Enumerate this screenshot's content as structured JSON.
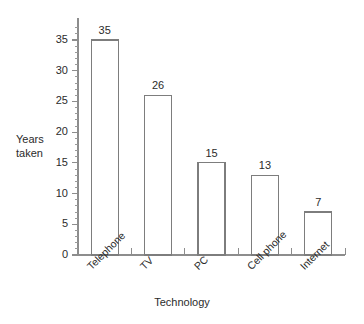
{
  "chart_data": {
    "type": "bar",
    "title": "",
    "subtitle": "",
    "xlabel": "Technology",
    "ylabel": "Years taken",
    "categories": [
      "Telephone",
      "TV",
      "PC",
      "Cell phone",
      "Internet"
    ],
    "values": [
      35,
      26,
      15,
      13,
      7
    ],
    "series": [
      {
        "name": "Years taken",
        "values": [
          35,
          26,
          15,
          13,
          7
        ]
      }
    ],
    "data_labels": [
      "35",
      "26",
      "15",
      "13",
      "7"
    ],
    "ylim": [
      0,
      35
    ],
    "y_ticks": [
      0,
      5,
      10,
      15,
      20,
      25,
      30,
      35
    ],
    "y_tick_labels": [
      "0",
      "5",
      "10",
      "15",
      "20",
      "25",
      "30",
      "35"
    ],
    "y_minor_tick_step": 1,
    "grid": false,
    "legend": "none",
    "bar_fill": "#ffffff",
    "bar_stroke": "#7d7d7d",
    "axis_color": "#8d8d8d",
    "text_color": "#2b2b2b",
    "background": "#ffffff",
    "x_tick_style": "category-boundaries",
    "category_label_rotation": "-45"
  },
  "axes": {
    "y_caption_line1": "Years",
    "y_caption_line2": "taken",
    "x_title": "Technology"
  }
}
